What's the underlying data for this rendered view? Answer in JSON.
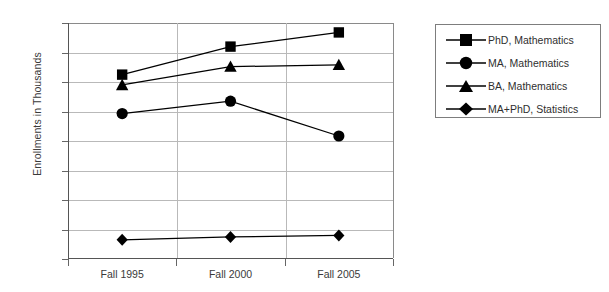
{
  "chart_data": {
    "type": "line",
    "title": "",
    "xlabel": "",
    "ylabel": "Enrollments in Thousands",
    "categories": [
      "Fall 1995",
      "Fall 2000",
      "Fall 2005"
    ],
    "ylim": [
      0,
      800
    ],
    "yticks": [
      0,
      100,
      200,
      300,
      400,
      500,
      600,
      700,
      800
    ],
    "ytick_labels": [
      "0",
      "100",
      "200",
      "300",
      "400",
      "500",
      "600",
      "700",
      "800"
    ],
    "grid": "horizontal-and-vertical",
    "legend_position": "right-outside",
    "series": [
      {
        "name": "PhD, Mathematics",
        "marker": "square",
        "color": "#000000",
        "values": [
          625,
          720,
          768
        ]
      },
      {
        "name": "MA, Mathematics",
        "marker": "circle",
        "color": "#000000",
        "values": [
          493,
          535,
          417
        ]
      },
      {
        "name": "BA, Mathematics",
        "marker": "triangle",
        "color": "#000000",
        "values": [
          590,
          652,
          658
        ]
      },
      {
        "name": "MA+PhD, Statistics",
        "marker": "diamond",
        "color": "#000000",
        "values": [
          65,
          75,
          80
        ]
      }
    ]
  },
  "axes": {
    "y_title": "Enrollments in Thousands",
    "y_labels": [
      "800",
      "700",
      "600",
      "500",
      "400",
      "300",
      "200",
      "100",
      "0"
    ],
    "x_labels": [
      "Fall 1995",
      "Fall 2000",
      "Fall 2005"
    ]
  },
  "legend": {
    "entries": [
      {
        "label": "PhD, Mathematics",
        "marker": "square"
      },
      {
        "label": "MA, Mathematics",
        "marker": "circle"
      },
      {
        "label": "BA, Mathematics",
        "marker": "triangle"
      },
      {
        "label": "MA+PhD, Statistics",
        "marker": "diamond"
      }
    ]
  },
  "colors": {
    "background": "#ffffff",
    "axis": "#555555",
    "gridline": "#b9b9b9",
    "series": "#000000",
    "text": "#3a3a3a",
    "legend_border": "#7d7d7d"
  }
}
